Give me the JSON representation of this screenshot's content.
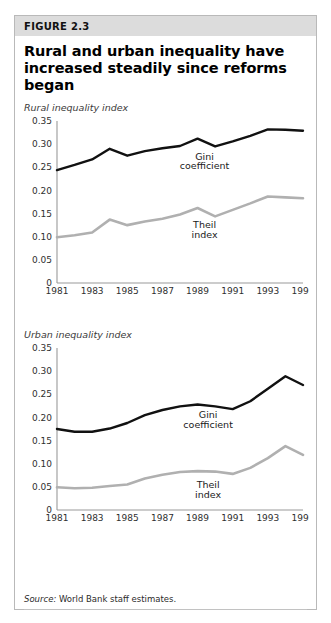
{
  "figure": {
    "number_label": "FIGURE 2.3",
    "title": "Rural and urban inequality have increased steadily since reforms began",
    "source_lead": "Source:",
    "source_rest": " World Bank staff estimates."
  },
  "colors": {
    "gini_line": "#111111",
    "theil_line": "#b0b0b0",
    "axis": "#9a9a9a",
    "header_band": "#dcdcdc",
    "frame": "#b9b9b9",
    "text": "#000000"
  },
  "chart_data": [
    {
      "type": "line",
      "title": "Rural inequality index",
      "xlabel": "",
      "ylabel": "",
      "ylim": [
        0,
        0.35
      ],
      "yticks": [
        "0",
        "0.05",
        "0.10",
        "0.15",
        "0.20",
        "0.25",
        "0.30",
        "0.35"
      ],
      "ytick_values": [
        0,
        0.05,
        0.1,
        0.15,
        0.2,
        0.25,
        0.3,
        0.35
      ],
      "grid": false,
      "legend_position": "inline-annotation",
      "x": [
        1981,
        1982,
        1983,
        1984,
        1985,
        1986,
        1987,
        1988,
        1989,
        1990,
        1991,
        1992,
        1993,
        1994,
        1995
      ],
      "xtick_labels": [
        "1981",
        "1983",
        "1985",
        "1987",
        "1989",
        "1991",
        "1993",
        "1995"
      ],
      "xtick_values": [
        1981,
        1983,
        1985,
        1987,
        1989,
        1991,
        1993,
        1995
      ],
      "series": [
        {
          "name": "Gini coefficient",
          "color": "#111111",
          "values": [
            0.244,
            0.255,
            0.267,
            0.29,
            0.275,
            0.285,
            0.291,
            0.296,
            0.312,
            0.295,
            0.306,
            0.318,
            0.332,
            0.331,
            0.329
          ]
        },
        {
          "name": "Theil index",
          "color": "#b0b0b0",
          "values": [
            0.099,
            0.103,
            0.109,
            0.137,
            0.125,
            0.133,
            0.139,
            0.148,
            0.162,
            0.144,
            0.158,
            0.172,
            0.187,
            0.185,
            0.183
          ]
        }
      ],
      "annotations": [
        {
          "text": "Gini",
          "series": "Gini coefficient",
          "x": 1989.4,
          "y": 0.266
        },
        {
          "text": "coefficient",
          "series": "Gini coefficient",
          "x": 1989.4,
          "y": 0.246
        },
        {
          "text": "Theil",
          "series": "Theil index",
          "x": 1989.4,
          "y": 0.118
        },
        {
          "text": "index",
          "series": "Theil index",
          "x": 1989.4,
          "y": 0.098
        }
      ]
    },
    {
      "type": "line",
      "title": "Urban inequality index",
      "xlabel": "",
      "ylabel": "",
      "ylim": [
        0,
        0.35
      ],
      "yticks": [
        "0",
        "0.05",
        "0.10",
        "0.15",
        "0.20",
        "0.25",
        "0.30",
        "0.35"
      ],
      "ytick_values": [
        0,
        0.05,
        0.1,
        0.15,
        0.2,
        0.25,
        0.3,
        0.35
      ],
      "grid": false,
      "legend_position": "inline-annotation",
      "x": [
        1981,
        1982,
        1983,
        1984,
        1985,
        1986,
        1987,
        1988,
        1989,
        1990,
        1991,
        1992,
        1993,
        1994,
        1995
      ],
      "xtick_labels": [
        "1981",
        "1983",
        "1985",
        "1987",
        "1989",
        "1991",
        "1993",
        "1995"
      ],
      "xtick_values": [
        1981,
        1983,
        1985,
        1987,
        1989,
        1991,
        1993,
        1995
      ],
      "series": [
        {
          "name": "Gini coefficient",
          "color": "#111111",
          "values": [
            0.175,
            0.169,
            0.169,
            0.176,
            0.188,
            0.205,
            0.216,
            0.224,
            0.228,
            0.224,
            0.218,
            0.235,
            0.262,
            0.289,
            0.27
          ]
        },
        {
          "name": "Theil index",
          "color": "#b0b0b0",
          "values": [
            0.049,
            0.047,
            0.048,
            0.052,
            0.055,
            0.068,
            0.076,
            0.082,
            0.084,
            0.083,
            0.078,
            0.091,
            0.112,
            0.138,
            0.119
          ]
        }
      ],
      "annotations": [
        {
          "text": "Gini",
          "series": "Gini coefficient",
          "x": 1989.6,
          "y": 0.198
        },
        {
          "text": "coefficient",
          "series": "Gini coefficient",
          "x": 1989.6,
          "y": 0.178
        },
        {
          "text": "Theil",
          "series": "Theil index",
          "x": 1989.6,
          "y": 0.047
        },
        {
          "text": "index",
          "series": "Theil index",
          "x": 1989.6,
          "y": 0.027
        }
      ]
    }
  ]
}
